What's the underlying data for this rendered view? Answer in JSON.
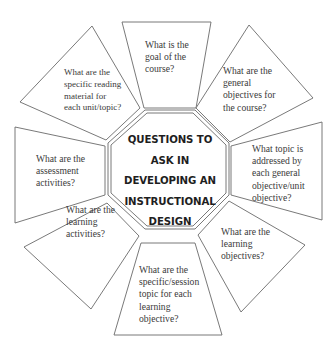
{
  "diagram": {
    "title_lines": [
      "QUESTIONS TO",
      "ASK IN",
      "DEVELOPING AN",
      "INSTRUCTIONAL",
      "DESIGN"
    ],
    "questions": [
      {
        "position": "top",
        "lines": [
          "What is the",
          "goal of the",
          "course?"
        ]
      },
      {
        "position": "top-right",
        "lines": [
          "What are the",
          "general",
          "objectives for",
          "the course?"
        ]
      },
      {
        "position": "right",
        "lines": [
          "What topic is",
          "addressed by",
          "each general",
          "objective/unit",
          "objective?"
        ]
      },
      {
        "position": "bottom-right",
        "lines": [
          "What are the",
          "learning",
          "objectives?"
        ]
      },
      {
        "position": "bottom",
        "lines": [
          "What are the",
          "specific/session",
          "topic for each",
          "learning",
          "objective?"
        ]
      },
      {
        "position": "bottom-left",
        "lines": [
          "What are the",
          "learning",
          "activities?"
        ]
      },
      {
        "position": "left",
        "lines": [
          "What are the",
          "assessment",
          "activities?"
        ]
      },
      {
        "position": "top-left",
        "lines": [
          "What are the",
          "specific reading",
          "material for",
          "each unit/topic?"
        ]
      }
    ],
    "colors": {
      "stroke": "#6a6a6a",
      "text": "#3a3a3a",
      "title": "#1e1e1e",
      "background": "#ffffff"
    }
  }
}
